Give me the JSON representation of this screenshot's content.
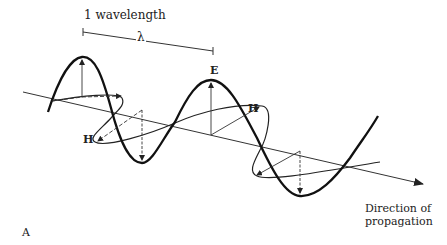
{
  "figure": {
    "panel_label": "A",
    "wavelength_label": "1 wavelength",
    "wavelength_symbol": "λ",
    "electric_field_label": "E",
    "magnetic_field_labels": [
      "H",
      "H"
    ],
    "direction_label_line1": "Direction of",
    "direction_label_line2": "propagation"
  },
  "colors": {
    "ink": "#222222",
    "background": "#ffffff"
  }
}
